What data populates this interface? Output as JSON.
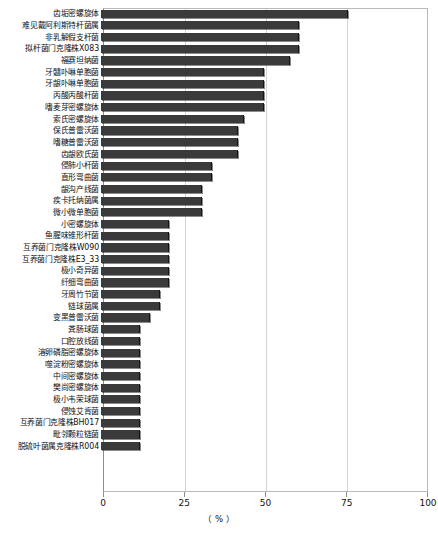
{
  "chart_data": {
    "type": "bar",
    "orientation": "horizontal",
    "title": "",
    "xlabel": "（ % ）",
    "ylabel": "",
    "xlim": [
      0,
      100
    ],
    "xticks": [
      0,
      25,
      50,
      75,
      100
    ],
    "xtick_labels": [
      "0",
      "25",
      "50",
      "75",
      "100"
    ],
    "grid": true,
    "grid_axis": "x",
    "legend": null,
    "bar_color": "#3a3a3a",
    "categories": [
      "齿垢密螺旋体",
      "难见戴阿利斯特杆菌属",
      "非乳解假支杆菌",
      "拟杆菌门克隆株X083",
      "福赛坦纳菌",
      "牙髓卟啉单胞菌",
      "牙龈卟啉单胞菌",
      "丙酸丙酸杆菌",
      "嗜麦芽密螺旋体",
      "索氏密螺旋体",
      "保氏普雷沃菌",
      "嗜糖普雷沃菌",
      "齿龈欧氏菌",
      "侵肺小杆菌",
      "直形弯曲菌",
      "龈沟产线菌",
      "疾卡托纳菌属",
      "微小微单胞菌",
      "小密螺旋体",
      "鱼腥味锥形杆菌",
      "互养菌门克隆株W090",
      "互养菌门克隆株E3_33",
      "极小奇异菌",
      "纤细弯曲菌",
      "牙周竹节菌",
      "链球菌属",
      "变黑普雷沃菌",
      "粪肠球菌",
      "口腔放线菌",
      "溶卵磷脂密螺旋体",
      "噬淀粉密螺旋体",
      "中间密螺旋体",
      "樊尚密螺旋体",
      "极小韦荣球菌",
      "侵蚀艾肯菌",
      "互养菌门克隆株BH017",
      "毗邻颗粒链菌",
      "脱硫叶菌属克隆株R004"
    ],
    "values": [
      76,
      61,
      61,
      61,
      58,
      50,
      50,
      50,
      50,
      44,
      42,
      42,
      42,
      34,
      34,
      31,
      31,
      31,
      21,
      21,
      21,
      21,
      21,
      21,
      18,
      18,
      15,
      12,
      12,
      12,
      12,
      12,
      12,
      12,
      12,
      12,
      12,
      12
    ]
  },
  "axis": {
    "unit_label": "（ % ）"
  },
  "caption": {
    "text": ""
  }
}
